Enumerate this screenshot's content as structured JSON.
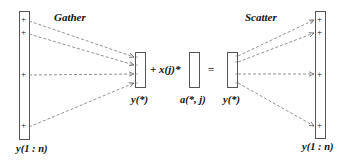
{
  "diagram": {
    "titles": {
      "gather": "Gather",
      "scatter": "Scatter"
    },
    "labels": {
      "left_vector": "y(1 : n)",
      "right_vector": "y(1 : n)",
      "gathered": "y(*)",
      "column": "a(*, j)",
      "result": "y(*)"
    },
    "operators": {
      "plus_term": "+ x(j)*",
      "equals": "="
    },
    "markers": {
      "plus": "+"
    },
    "colors": {
      "line": "#555555",
      "dashed": "#777777",
      "text": "#111111"
    }
  }
}
